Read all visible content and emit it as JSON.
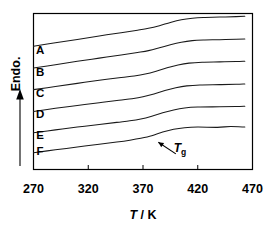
{
  "chart_data": {
    "type": "line",
    "title": "",
    "xlabel": "T / K",
    "xlabel_italic_part": "T",
    "xlabel_rest": " / K",
    "ylabel": "Endo.",
    "ylabel_arrow": "upward-arrow",
    "xlim": [
      270,
      470
    ],
    "ylim": [
      0,
      1
    ],
    "xticks": [
      270,
      320,
      370,
      420,
      470
    ],
    "xtick_labels": [
      "270",
      "320",
      "370",
      "420",
      "470"
    ],
    "yticks": [],
    "ytick_labels": [],
    "grid": false,
    "legend": "none",
    "frame": "box",
    "annotations": [
      {
        "text": "Tg",
        "text_main": "T",
        "text_sub": "g",
        "italic": true,
        "x": 398,
        "y": 0.115,
        "arrow_from": [
          400,
          0.1
        ],
        "arrow_to": [
          384,
          0.175
        ],
        "note": "glass transition marker on curve F"
      }
    ],
    "series": [
      {
        "name": "A",
        "label": "A",
        "label_x": 276,
        "label_y": 0.742,
        "points": [
          [
            270,
            0.79
          ],
          [
            290,
            0.812
          ],
          [
            310,
            0.834
          ],
          [
            330,
            0.856
          ],
          [
            350,
            0.877
          ],
          [
            365,
            0.893
          ],
          [
            375,
            0.905
          ],
          [
            385,
            0.922
          ],
          [
            395,
            0.943
          ],
          [
            405,
            0.96
          ],
          [
            415,
            0.97
          ],
          [
            425,
            0.975
          ],
          [
            440,
            0.977
          ],
          [
            455,
            0.98
          ],
          [
            463,
            0.982
          ]
        ]
      },
      {
        "name": "B",
        "label": "B",
        "label_x": 276,
        "label_y": 0.602,
        "points": [
          [
            270,
            0.65
          ],
          [
            290,
            0.672
          ],
          [
            310,
            0.694
          ],
          [
            330,
            0.714
          ],
          [
            350,
            0.734
          ],
          [
            365,
            0.75
          ],
          [
            375,
            0.762
          ],
          [
            385,
            0.78
          ],
          [
            395,
            0.8
          ],
          [
            405,
            0.816
          ],
          [
            415,
            0.826
          ],
          [
            425,
            0.83
          ],
          [
            440,
            0.832
          ],
          [
            455,
            0.835
          ],
          [
            463,
            0.837
          ]
        ]
      },
      {
        "name": "C",
        "label": "C",
        "label_x": 276,
        "label_y": 0.462,
        "points": [
          [
            270,
            0.512
          ],
          [
            290,
            0.532
          ],
          [
            310,
            0.552
          ],
          [
            330,
            0.572
          ],
          [
            350,
            0.59
          ],
          [
            362,
            0.6
          ],
          [
            372,
            0.612
          ],
          [
            382,
            0.63
          ],
          [
            392,
            0.652
          ],
          [
            402,
            0.67
          ],
          [
            412,
            0.682
          ],
          [
            424,
            0.688
          ],
          [
            440,
            0.69
          ],
          [
            455,
            0.692
          ],
          [
            463,
            0.694
          ]
        ]
      },
      {
        "name": "D",
        "label": "D",
        "label_x": 276,
        "label_y": 0.33,
        "points": [
          [
            270,
            0.372
          ],
          [
            290,
            0.392
          ],
          [
            310,
            0.41
          ],
          [
            330,
            0.428
          ],
          [
            348,
            0.444
          ],
          [
            360,
            0.454
          ],
          [
            370,
            0.466
          ],
          [
            380,
            0.484
          ],
          [
            390,
            0.506
          ],
          [
            400,
            0.524
          ],
          [
            410,
            0.536
          ],
          [
            422,
            0.542
          ],
          [
            440,
            0.544
          ],
          [
            455,
            0.546
          ],
          [
            463,
            0.548
          ]
        ]
      },
      {
        "name": "E",
        "label": "E",
        "label_x": 276,
        "label_y": 0.196,
        "points": [
          [
            270,
            0.236
          ],
          [
            290,
            0.254
          ],
          [
            310,
            0.272
          ],
          [
            330,
            0.288
          ],
          [
            346,
            0.302
          ],
          [
            358,
            0.312
          ],
          [
            368,
            0.324
          ],
          [
            378,
            0.342
          ],
          [
            388,
            0.364
          ],
          [
            398,
            0.382
          ],
          [
            408,
            0.394
          ],
          [
            420,
            0.4
          ],
          [
            440,
            0.402
          ],
          [
            455,
            0.404
          ],
          [
            463,
            0.406
          ]
        ]
      },
      {
        "name": "F",
        "label": "F",
        "label_x": 276,
        "label_y": 0.095,
        "points": [
          [
            270,
            0.108
          ],
          [
            290,
            0.126
          ],
          [
            310,
            0.144
          ],
          [
            330,
            0.162
          ],
          [
            346,
            0.176
          ],
          [
            358,
            0.188
          ],
          [
            368,
            0.2
          ],
          [
            378,
            0.216
          ],
          [
            388,
            0.24
          ],
          [
            398,
            0.258
          ],
          [
            408,
            0.268
          ],
          [
            420,
            0.272
          ],
          [
            438,
            0.27
          ],
          [
            450,
            0.276
          ],
          [
            463,
            0.272
          ]
        ]
      }
    ]
  }
}
